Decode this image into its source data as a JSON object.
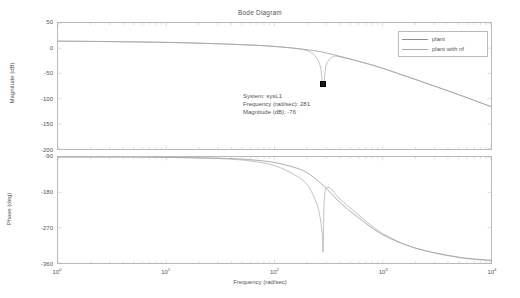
{
  "title": "Bode Diagram",
  "legend": {
    "items": [
      {
        "label": "plant",
        "color": "#8d8d8d"
      },
      {
        "label": "plant with nf",
        "color": "#a8a8a8"
      }
    ]
  },
  "datatip": {
    "line1": "System: sysL1",
    "line2": "Frequency (rad/sec): 281",
    "line3": "Magnitude (dB): -76",
    "marker_color": "#1a1a1a"
  },
  "axes": {
    "xlabel": "Frequency  (rad/sec)",
    "xticks": [
      "0",
      "1",
      "2",
      "3",
      "4"
    ],
    "xbase": "10",
    "magnitude": {
      "ylabel": "Magnitude (dB)",
      "yticks": [
        "50",
        "0",
        "-50",
        "-100",
        "-150",
        "-200"
      ]
    },
    "phase": {
      "ylabel": "Phase (deg)",
      "yticks": [
        "-90",
        "-180",
        "-270",
        "-360"
      ]
    }
  },
  "chart_data": {
    "type": "line",
    "title": "Bode Diagram",
    "xlabel": "Frequency  (rad/sec)",
    "xscale": "log",
    "xlim": [
      1,
      10000
    ],
    "subplots": [
      {
        "name": "magnitude",
        "ylabel": "Magnitude (dB)",
        "ylim": [
          -200,
          50
        ],
        "yticks": [
          50,
          0,
          -50,
          -100,
          -150,
          -200
        ],
        "grid": false,
        "series": [
          {
            "name": "plant",
            "color": "#8d8d8d",
            "x": [
              1,
              2,
              5,
              10,
              20,
              50,
              100,
              200,
              281,
              400,
              700,
              1000,
              2000,
              5000,
              10000
            ],
            "y": [
              14,
              13.5,
              12.5,
              11.5,
              10,
              7,
              3.5,
              -3,
              -8,
              -16,
              -30,
              -40,
              -62,
              -92,
              -116
            ]
          },
          {
            "name": "plant with nf",
            "color": "#a8a8a8",
            "x": [
              1,
              2,
              5,
              10,
              20,
              50,
              100,
              200,
              260,
              281,
              300,
              340,
              400,
              700,
              1000,
              2000,
              5000,
              10000
            ],
            "y": [
              14,
              13.5,
              12.5,
              11.5,
              10,
              7,
              3.5,
              -5,
              -30,
              -76,
              -34,
              -18,
              -17,
              -30,
              -40,
              -62,
              -92,
              -116
            ]
          }
        ]
      },
      {
        "name": "phase",
        "ylabel": "Phase (deg)",
        "ylim": [
          -360,
          -90
        ],
        "yticks": [
          -90,
          -180,
          -270,
          -360
        ],
        "grid": false,
        "series": [
          {
            "name": "plant",
            "color": "#8d8d8d",
            "x": [
              1,
              5,
              10,
              30,
              60,
              100,
              150,
              200,
              281,
              400,
              600,
              1000,
              2000,
              5000,
              10000
            ],
            "y": [
              -90,
              -90,
              -91,
              -93,
              -97,
              -104,
              -116,
              -130,
              -162,
              -205,
              -245,
              -288,
              -322,
              -345,
              -353
            ]
          },
          {
            "name": "plant with nf",
            "color": "#a8a8a8",
            "x": [
              1,
              5,
              10,
              30,
              60,
              100,
              150,
              200,
              250,
              275,
              281,
              290,
              320,
              400,
              600,
              1000,
              2000,
              5000,
              10000
            ],
            "y": [
              -90,
              -90,
              -91,
              -94,
              -100,
              -112,
              -134,
              -160,
              -215,
              -280,
              -330,
              -190,
              -168,
              -196,
              -238,
              -285,
              -322,
              -346,
              -354
            ]
          }
        ]
      }
    ]
  }
}
